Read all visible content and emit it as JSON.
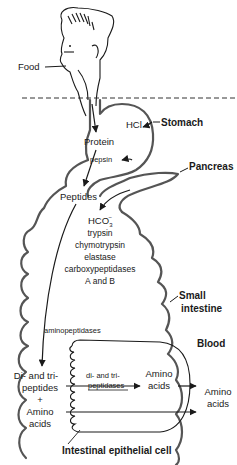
{
  "diagram": {
    "labels": {
      "food": "Food",
      "hcl": "HCl",
      "stomach": "Stomach",
      "protein": "Protein",
      "pepsin": "pepsin",
      "pancreas": "Pancreas",
      "peptides": "Peptides",
      "hco3_base": "HCO",
      "hco3_sub": "3",
      "hco3_sup": "−",
      "trypsin": "trypsin",
      "chymotrypsin": "chymotrypsin",
      "elastase": "elastase",
      "carboxypeptidases": "carboxypeptidases",
      "a_and_b": "A and B",
      "small": "Small",
      "intestine": "intestine",
      "aminopeptidases": "aminopeptidases",
      "blood": "Blood",
      "di_tri_1": "Di- and tri-",
      "di_tri_2": "peptides",
      "plus": "+",
      "amino_1": "Amino",
      "amino_2": "acids",
      "cell_enzyme_1": "di- and tri-",
      "cell_enzyme_2": "peptidases",
      "cell_amino_1": "Amino",
      "cell_amino_2": "acids",
      "blood_amino_1": "Amino",
      "blood_amino_2": "acids",
      "epithelial_cell": "Intestinal epithelial cell"
    },
    "colors": {
      "gut_outline": "#555555",
      "text": "#1a1a1a",
      "background": "#ffffff"
    }
  }
}
